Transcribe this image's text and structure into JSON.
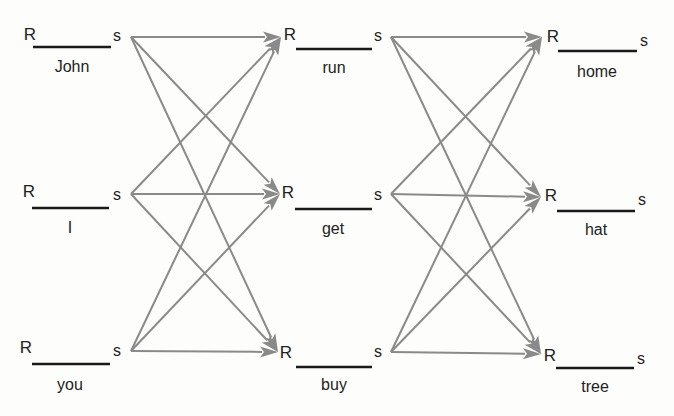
{
  "diagram": {
    "type": "stimulus-response chain network",
    "edge_color": "#8a8a8a",
    "bar_color": "#1a1a1a",
    "response_label": "R",
    "stimulus_label": "s",
    "columns": [
      {
        "id": "col1",
        "nodes": [
          {
            "word": "John",
            "R": {
              "x": 30,
              "y": 40
            },
            "bar": {
              "x1": 33,
              "x2": 111,
              "y": 47
            },
            "word_pos": {
              "x": 72,
              "y": 72
            },
            "s": {
              "x": 117,
              "y": 41
            },
            "out": {
              "x": 131,
              "y": 37
            }
          },
          {
            "word": "I",
            "R": {
              "x": 29,
              "y": 197
            },
            "bar": {
              "x1": 32,
              "x2": 109,
              "y": 208
            },
            "word_pos": {
              "x": 70,
              "y": 233
            },
            "s": {
              "x": 117,
              "y": 200
            },
            "out": {
              "x": 131,
              "y": 194
            }
          },
          {
            "word": "you",
            "R": {
              "x": 26,
              "y": 353
            },
            "bar": {
              "x1": 32,
              "x2": 110,
              "y": 364
            },
            "word_pos": {
              "x": 70,
              "y": 390
            },
            "s": {
              "x": 117,
              "y": 356
            },
            "out": {
              "x": 131,
              "y": 351
            }
          }
        ]
      },
      {
        "id": "col2",
        "nodes": [
          {
            "word": "run",
            "R": {
              "x": 290,
              "y": 40
            },
            "bar": {
              "x1": 296,
              "x2": 372,
              "y": 49
            },
            "word_pos": {
              "x": 334,
              "y": 73
            },
            "s": {
              "x": 378,
              "y": 41
            },
            "in": {
              "x": 281,
              "y": 37
            },
            "out": {
              "x": 391,
              "y": 37
            }
          },
          {
            "word": "get",
            "R": {
              "x": 288,
              "y": 198
            },
            "bar": {
              "x1": 295,
              "x2": 372,
              "y": 209
            },
            "word_pos": {
              "x": 333,
              "y": 234
            },
            "s": {
              "x": 378,
              "y": 200
            },
            "in": {
              "x": 280,
              "y": 194
            },
            "out": {
              "x": 391,
              "y": 194
            }
          },
          {
            "word": "buy",
            "R": {
              "x": 286,
              "y": 358
            },
            "bar": {
              "x1": 296,
              "x2": 372,
              "y": 367
            },
            "word_pos": {
              "x": 334,
              "y": 390
            },
            "s": {
              "x": 378,
              "y": 357
            },
            "in": {
              "x": 278,
              "y": 352
            },
            "out": {
              "x": 391,
              "y": 352
            }
          }
        ]
      },
      {
        "id": "col3",
        "nodes": [
          {
            "word": "home",
            "R": {
              "x": 553,
              "y": 42
            },
            "bar": {
              "x1": 558,
              "x2": 637,
              "y": 51
            },
            "word_pos": {
              "x": 597,
              "y": 77
            },
            "s": {
              "x": 644,
              "y": 46
            },
            "in": {
              "x": 542,
              "y": 37
            }
          },
          {
            "word": "hat",
            "R": {
              "x": 551,
              "y": 201
            },
            "bar": {
              "x1": 557,
              "x2": 635,
              "y": 211
            },
            "word_pos": {
              "x": 596,
              "y": 235
            },
            "s": {
              "x": 642,
              "y": 205
            },
            "in": {
              "x": 541,
              "y": 197
            }
          },
          {
            "word": "tree",
            "R": {
              "x": 550,
              "y": 361
            },
            "bar": {
              "x1": 556,
              "x2": 634,
              "y": 368
            },
            "word_pos": {
              "x": 595,
              "y": 392
            },
            "s": {
              "x": 641,
              "y": 364
            },
            "in": {
              "x": 541,
              "y": 354
            }
          }
        ]
      }
    ],
    "edges": [
      {
        "from": "John",
        "to": "run"
      },
      {
        "from": "John",
        "to": "get"
      },
      {
        "from": "John",
        "to": "buy"
      },
      {
        "from": "I",
        "to": "run"
      },
      {
        "from": "I",
        "to": "get"
      },
      {
        "from": "I",
        "to": "buy"
      },
      {
        "from": "you",
        "to": "run"
      },
      {
        "from": "you",
        "to": "get"
      },
      {
        "from": "you",
        "to": "buy"
      },
      {
        "from": "run",
        "to": "home"
      },
      {
        "from": "run",
        "to": "hat"
      },
      {
        "from": "run",
        "to": "tree"
      },
      {
        "from": "get",
        "to": "home"
      },
      {
        "from": "get",
        "to": "hat"
      },
      {
        "from": "get",
        "to": "tree"
      },
      {
        "from": "buy",
        "to": "home"
      },
      {
        "from": "buy",
        "to": "hat"
      },
      {
        "from": "buy",
        "to": "tree"
      }
    ]
  }
}
